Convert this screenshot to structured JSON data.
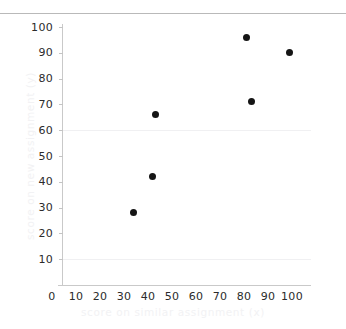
{
  "figure": {
    "background_color": "#ffffff",
    "top_rule_color": "#b9b9b9"
  },
  "chart_data": {
    "type": "scatter",
    "title": "",
    "xlabel": "score on similar assignment (x)",
    "ylabel": "score on new assignment (y)",
    "xlim": [
      0,
      100
    ],
    "ylim": [
      0,
      100
    ],
    "xticks": [
      0,
      10,
      20,
      30,
      40,
      50,
      60,
      70,
      80,
      90,
      100
    ],
    "yticks": [
      10,
      20,
      30,
      40,
      50,
      60,
      70,
      80,
      90,
      100
    ],
    "xtick_labels": [
      "0",
      "10",
      "20",
      "30",
      "40",
      "50",
      "60",
      "70",
      "80",
      "90",
      "100"
    ],
    "ytick_labels": [
      "10",
      "20",
      "30",
      "40",
      "50",
      "60",
      "70",
      "80",
      "90",
      "100"
    ],
    "grid": true,
    "gridlines_y": [
      10,
      60
    ],
    "legend": null,
    "marker_color": "#151515",
    "points": [
      {
        "x": 34,
        "y": 28
      },
      {
        "x": 42,
        "y": 42
      },
      {
        "x": 43,
        "y": 66
      },
      {
        "x": 81,
        "y": 96
      },
      {
        "x": 83,
        "y": 71
      },
      {
        "x": 99,
        "y": 90
      }
    ]
  }
}
